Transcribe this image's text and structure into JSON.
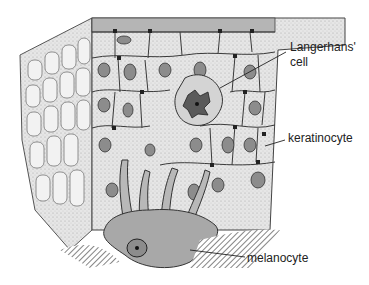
{
  "figure": {
    "type": "epidermis cross-section illustration",
    "labels": {
      "langerhans_line1": "Langerhans'",
      "langerhans_line2": "cell",
      "keratinocyte": "keratinocyte",
      "melanocyte": "melanocyte"
    },
    "colors": {
      "tissue_fill": "#e4e4e4",
      "cell_outline": "#3a3a3a",
      "nucleus_fill": "#8c8c8c",
      "melanocyte_fill": "#a8a8a8",
      "langerhans_fill": "#5a5a5a",
      "text": "#222222"
    }
  }
}
